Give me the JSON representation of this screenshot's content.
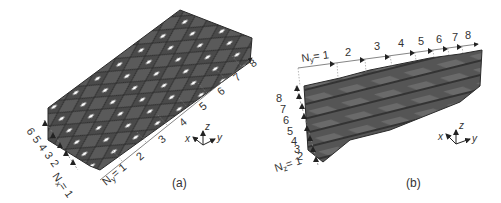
{
  "panels": [
    {
      "id": "a",
      "caption": "(a)",
      "nx_label": "N",
      "nx_sub": "x",
      "nx_eq": "= 1",
      "nx_ticks": [
        "2",
        "3",
        "4",
        "5",
        "6"
      ],
      "ny_label": "N",
      "ny_sub": "y",
      "ny_eq": "= 1",
      "ny_ticks": [
        "2",
        "3",
        "4",
        "5",
        "6",
        "7",
        "8"
      ],
      "axes": {
        "x": "x",
        "y": "y",
        "z": "z"
      }
    },
    {
      "id": "b",
      "caption": "(b)",
      "ny_label": "N",
      "ny_sub": "y",
      "ny_eq": "= 1",
      "ny_ticks": [
        "2",
        "3",
        "4",
        "5",
        "6",
        "7",
        "8"
      ],
      "nz_label": "N",
      "nz_sub": "z",
      "nz_eq": "= 1",
      "nz_ticks": [
        "2",
        "3",
        "4",
        "5",
        "6",
        "7",
        "8"
      ],
      "axes": {
        "x": "x",
        "y": "y",
        "z": "z"
      }
    }
  ],
  "colors": {
    "surface": "#5a5a5a",
    "surface_dark": "#3e3e3e",
    "edge": "#2a2a2a",
    "guide": "#888888",
    "text": "#333333"
  }
}
